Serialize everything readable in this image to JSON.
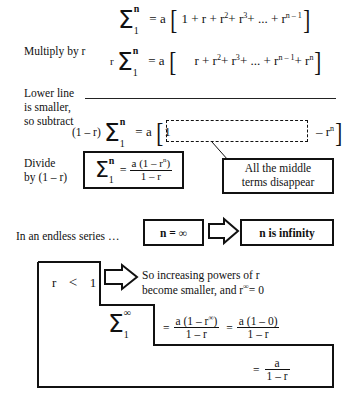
{
  "lines": {
    "eq1": {
      "lhs_sigma": {
        "top": "n",
        "bottom": "1"
      },
      "rhs": "= a",
      "bracket_open": "[",
      "terms": "1 + r + r",
      "t2_exp": "2",
      "t3": "+ r",
      "t3_exp": "3",
      "t4": "+ ... + r",
      "t4_exp": "n – 1",
      "bracket_close": "]"
    },
    "eq2": {
      "prefix": "r",
      "lhs_sigma": {
        "top": "n",
        "bottom": "1"
      },
      "rhs": "= a",
      "bracket_open": "[",
      "terms": "r + r",
      "t2_exp": "2",
      "t3": "+ r",
      "t3_exp": "3",
      "t4": "+ ... + r",
      "t4_exp": "n – 1",
      "t5": "+ r",
      "t5_exp": "n",
      "bracket_close": "]"
    },
    "eq3": {
      "prefix": "(1 – r)",
      "lhs_sigma": {
        "top": "n",
        "bottom": "1"
      },
      "rhs": "= a",
      "bracket_open": "[",
      "one": "1",
      "tail": "– r",
      "tail_exp": "n",
      "bracket_close": "]"
    }
  },
  "captions": {
    "multiply_by_r": "Multiply by r",
    "lower_line_1": "Lower line",
    "lower_line_2": "is smaller,",
    "lower_line_3": "so subtract",
    "divide_1": "Divide",
    "divide_2": "by (1 – r)",
    "endless_series": "In an endless series …"
  },
  "boxes": {
    "finite_sum": {
      "sigma": {
        "top": "n",
        "bottom": "1"
      },
      "equals": "=",
      "numerator": "a (1 – r",
      "numerator_exp": "n",
      "numerator_close": ")",
      "denominator": "1 – r"
    },
    "middle_terms": {
      "line1": "All the middle",
      "line2": "terms disappear"
    },
    "n_equals_infinity": "n = ∞",
    "n_is_infinity": "n is infinity",
    "r_less_than_one": {
      "r": "r",
      "op": "<",
      "one": "1"
    }
  },
  "notes": {
    "increasing_powers_1": "So increasing powers of r",
    "increasing_powers_2a": "become smaller, and r",
    "increasing_powers_2b": "∞",
    "increasing_powers_2c": "= 0"
  },
  "final": {
    "sigma": {
      "top": "∞",
      "bottom": "1"
    },
    "eq_a": "=",
    "num_a": "a (1 – r",
    "num_a_exp": "∞",
    "num_a_close": ")",
    "den_a": "1 – r",
    "eq_b": "=",
    "num_b": "a (1 – 0)",
    "den_b": "1 – r",
    "eq_c": "=",
    "num_c": "a",
    "den_c": "1 – r"
  },
  "colors": {
    "ink": "#111111",
    "background": "#ffffff"
  }
}
